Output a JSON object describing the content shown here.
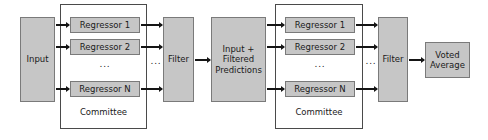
{
  "diagram": {
    "colors": {
      "box_fill": "#c6c6c6",
      "box_border": "#7a7a7a",
      "group_border": "#4a4a4a",
      "arrow": "#151515",
      "background": "#ffffff",
      "text": "#1a1a1a"
    },
    "stage1": {
      "input": {
        "label": "Input"
      },
      "committee": {
        "label": "Committee",
        "regressors": [
          {
            "label": "Regressor 1"
          },
          {
            "label": "Regressor 2"
          },
          {
            "label": "Regressor N"
          }
        ],
        "ellipsis": "..."
      },
      "ellipsis_out": "...",
      "filter": {
        "label": "Filter"
      }
    },
    "middle": {
      "label": "Input +\nFiltered\nPredictions",
      "line1": "Input +",
      "line2": "Filtered",
      "line3": "Predictions"
    },
    "stage2": {
      "committee": {
        "label": "Committee",
        "regressors": [
          {
            "label": "Regressor 1"
          },
          {
            "label": "Regressor 2"
          },
          {
            "label": "Regressor N"
          }
        ],
        "ellipsis": "..."
      },
      "ellipsis_out": "...",
      "filter": {
        "label": "Filter"
      }
    },
    "output": {
      "line1": "Voted",
      "line2": "Average"
    }
  }
}
